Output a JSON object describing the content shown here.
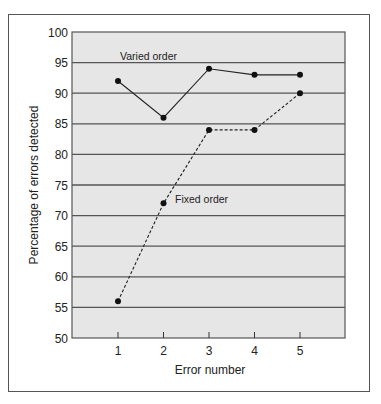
{
  "chart_data": {
    "type": "line",
    "title": "",
    "xlabel": "Error number",
    "ylabel": "Percentage of errors detected",
    "x": [
      1,
      2,
      3,
      4,
      5
    ],
    "xticks": [
      "1",
      "2",
      "3",
      "4",
      "5"
    ],
    "yticks": [
      "50",
      "55",
      "60",
      "65",
      "70",
      "75",
      "80",
      "85",
      "90",
      "95",
      "100"
    ],
    "ylim": [
      50,
      100
    ],
    "xlim": [
      0,
      6
    ],
    "grid": "horizontal",
    "legend": "inline labels",
    "series": [
      {
        "name": "Varied order",
        "values": [
          92,
          86,
          94,
          93,
          93
        ],
        "style": "solid"
      },
      {
        "name": "Fixed order",
        "values": [
          56,
          72,
          84,
          84,
          90
        ],
        "style": "dashed"
      }
    ]
  },
  "colors": {
    "plot_background": "#e6e6e6",
    "gridline": "#555555",
    "line": "#222222",
    "frame": "#555555"
  }
}
